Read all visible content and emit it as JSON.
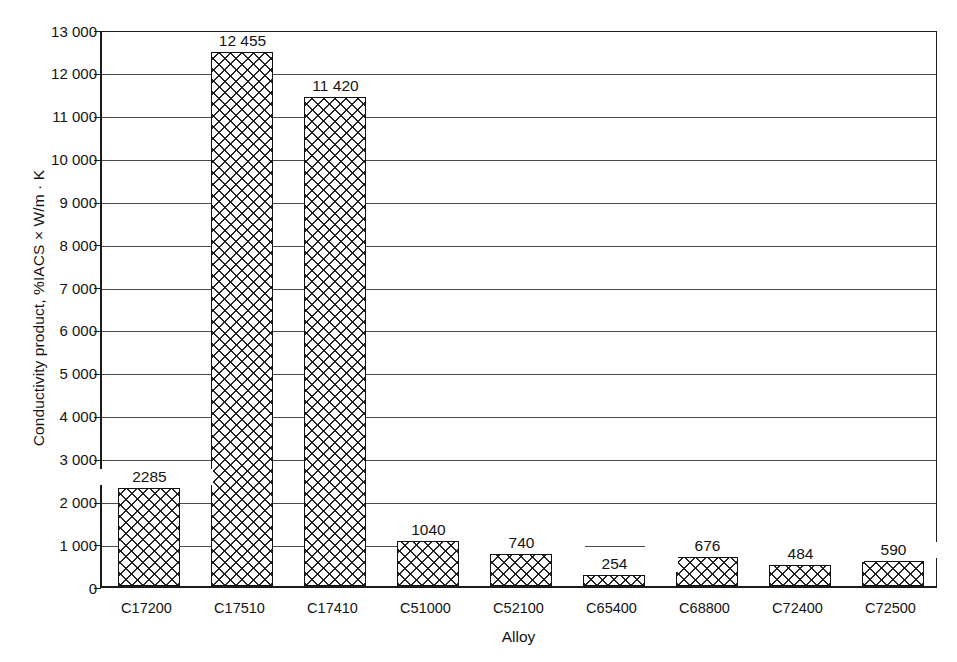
{
  "chart_data": {
    "type": "bar",
    "title": "",
    "xlabel": "Alloy",
    "ylabel": "Conductivity product, %IACS × W/m · K",
    "categories": [
      "C17200",
      "C17510",
      "C17410",
      "C51000",
      "C52100",
      "C65400",
      "C68800",
      "C72400",
      "C72500"
    ],
    "values": [
      2285,
      12455,
      11420,
      1040,
      740,
      254,
      676,
      484,
      590
    ],
    "value_labels": [
      "2285",
      "12 455",
      "11 420",
      "1040",
      "740",
      "254",
      "676",
      "484",
      "590"
    ],
    "ylim": [
      0,
      13000
    ],
    "ytick_values": [
      0,
      1000,
      2000,
      3000,
      4000,
      5000,
      6000,
      7000,
      8000,
      9000,
      10000,
      11000,
      12000,
      13000
    ],
    "ytick_labels": [
      "0",
      "1 000",
      "2 000",
      "3 000",
      "4 000",
      "5 000",
      "6 000",
      "7 000",
      "8 000",
      "9 000",
      "10 000",
      "11 000",
      "12 000",
      "13 000"
    ],
    "grid": true,
    "legend": "none",
    "bar_fill": "crosshatch",
    "bar_edge_color": "#111111",
    "axis_color": "#1b1b1b",
    "grid_color": "#4a4a4a",
    "background_color": "#ffffff"
  }
}
